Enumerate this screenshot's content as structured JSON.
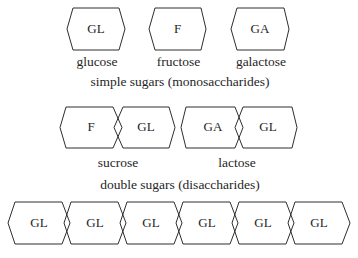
{
  "monosaccharides": {
    "items": [
      {
        "abbr": "GL",
        "name": "glucose"
      },
      {
        "abbr": "F",
        "name": "fructose"
      },
      {
        "abbr": "GA",
        "name": "galactose"
      }
    ],
    "caption": "simple sugars (monosaccharides)"
  },
  "disaccharides": {
    "items": [
      {
        "units": [
          "F",
          "GL"
        ],
        "name": "sucrose"
      },
      {
        "units": [
          "GA",
          "GL"
        ],
        "name": "lactose"
      }
    ],
    "caption": "double sugars (disaccharides)"
  },
  "polysaccharide": {
    "units": [
      "GL",
      "GL",
      "GL",
      "GL",
      "GL",
      "GL"
    ]
  },
  "colors": {
    "stroke": "#2e2e2e",
    "text": "#262626",
    "background": "#ffffff"
  }
}
